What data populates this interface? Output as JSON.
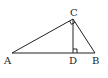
{
  "diagram": {
    "type": "geometry",
    "points": {
      "A": {
        "label": "A",
        "x": 12,
        "y": 53
      },
      "B": {
        "label": "B",
        "x": 95,
        "y": 53
      },
      "C": {
        "label": "C",
        "x": 73,
        "y": 19
      },
      "D": {
        "label": "D",
        "x": 73,
        "y": 53
      }
    },
    "segments": [
      "AB",
      "AC",
      "BC",
      "CD"
    ],
    "right_angles": [
      "ACB",
      "CDB"
    ],
    "labels": {
      "A": "A",
      "B": "B",
      "C": "C",
      "D": "D"
    },
    "colors": {
      "stroke": "#222222",
      "background": "#ffffff"
    }
  }
}
